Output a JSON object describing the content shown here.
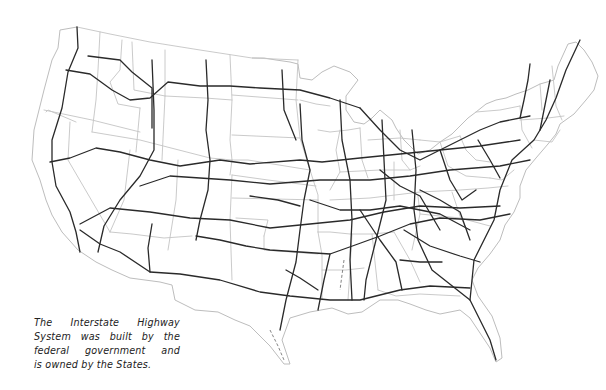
{
  "map": {
    "subject": "United States Interstate Highway System",
    "colors": {
      "background": "#ffffff",
      "highways": "#2a2a2a",
      "state_borders": "#c4c4c4"
    }
  },
  "caption": {
    "lines": [
      "The Interstate Highway",
      "System was built by the",
      "federal government and",
      "is owned by the States."
    ]
  }
}
